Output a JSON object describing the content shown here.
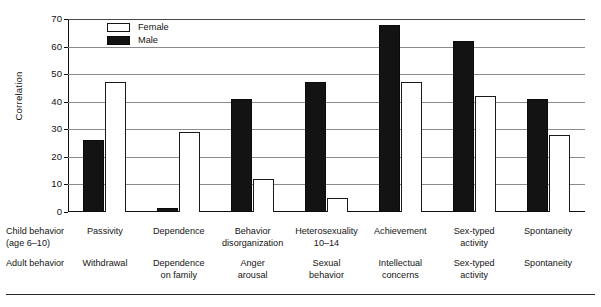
{
  "chart_data": {
    "type": "bar",
    "title": "",
    "subtitle": "",
    "xlabel": "",
    "ylabel": "Correlation",
    "ylim": [
      0,
      70
    ],
    "yticks": [
      0,
      10,
      20,
      30,
      40,
      50,
      60,
      70
    ],
    "grid": true,
    "legend_position": "top-left",
    "categories": [
      "Passivity",
      "Dependence",
      "Behavior disorganization",
      "Heterosexuality 10–14",
      "Achievement",
      "Sex-typed activity",
      "Spontaneity"
    ],
    "series": [
      {
        "name": "Male",
        "color": "#131313",
        "values": [
          26,
          1.5,
          41,
          47,
          68,
          62,
          41
        ]
      },
      {
        "name": "Female",
        "color": "#ffffff",
        "values": [
          47,
          29,
          12,
          5,
          47,
          42,
          28
        ]
      }
    ]
  },
  "legend": {
    "items": [
      {
        "label": "Female",
        "swatch": "open-square-swatch"
      },
      {
        "label": "Male",
        "swatch": "filled-square-swatch"
      }
    ]
  },
  "yaxis": {
    "title": "Correlation",
    "ticks": [
      "0",
      "10",
      "20",
      "30",
      "40",
      "50",
      "60",
      "70"
    ]
  },
  "label_rows": {
    "child": {
      "header_line1": "Child behavior",
      "header_line2": "(age 6–10)",
      "cells": [
        {
          "line1": "Passivity",
          "line2": ""
        },
        {
          "line1": "Dependence",
          "line2": ""
        },
        {
          "line1": "Behavior",
          "line2": "disorganization"
        },
        {
          "line1": "Heterosexuality",
          "line2": "10–14"
        },
        {
          "line1": "Achievement",
          "line2": ""
        },
        {
          "line1": "Sex-typed",
          "line2": "activity"
        },
        {
          "line1": "Spontaneity",
          "line2": ""
        }
      ]
    },
    "adult": {
      "header_line1": "Adult behavior",
      "header_line2": "",
      "cells": [
        {
          "line1": "Withdrawal",
          "line2": ""
        },
        {
          "line1": "Dependence",
          "line2": "on family"
        },
        {
          "line1": "Anger",
          "line2": "arousal"
        },
        {
          "line1": "Sexual",
          "line2": "behavior"
        },
        {
          "line1": "Intellectual",
          "line2": "concerns"
        },
        {
          "line1": "Sex-typed",
          "line2": "activity"
        },
        {
          "line1": "Spontaneity",
          "line2": ""
        }
      ]
    }
  },
  "colors": {
    "male_bar": "#131313",
    "female_bar": "#ffffff",
    "bar_outline": "#1a1a1a",
    "gridline": "#8c8c8c",
    "axis": "#111111",
    "text": "#141414",
    "background": "#ffffff"
  }
}
